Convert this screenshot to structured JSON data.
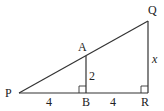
{
  "diagram": {
    "type": "similar-right-triangles",
    "points": {
      "P": {
        "label": "P"
      },
      "A": {
        "label": "A"
      },
      "B": {
        "label": "B"
      },
      "Q": {
        "label": "Q"
      },
      "R": {
        "label": "R"
      }
    },
    "segments": {
      "PB": {
        "label": "4"
      },
      "BR": {
        "label": "4"
      },
      "AB": {
        "label": "2"
      },
      "QR": {
        "label": "x"
      }
    },
    "right_angles": [
      "B",
      "R"
    ],
    "colors": {
      "stroke": "#333333",
      "text": "#222222",
      "background": "#ffffff"
    }
  }
}
